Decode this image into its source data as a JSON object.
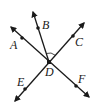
{
  "diagram": {
    "type": "intersecting-lines",
    "colors": {
      "line": "#1a1a1a",
      "background": "#ffffff"
    },
    "center": {
      "label": "D",
      "x": 49,
      "y": 62
    },
    "points": [
      {
        "label": "A",
        "dot": [
          22,
          38
        ],
        "tip": [
          11,
          27
        ],
        "label_pos": [
          10,
          49
        ]
      },
      {
        "label": "B",
        "dot": [
          38,
          28
        ],
        "tip": [
          33,
          12
        ],
        "label_pos": [
          42,
          29
        ]
      },
      {
        "label": "C",
        "dot": [
          73,
          36
        ],
        "tip": [
          84,
          23
        ],
        "label_pos": [
          75,
          46
        ]
      },
      {
        "label": "E",
        "dot": [
          25,
          89
        ],
        "tip": [
          15,
          101
        ],
        "label_pos": [
          17,
          86
        ]
      },
      {
        "label": "F",
        "dot": [
          76,
          86
        ],
        "tip": [
          89,
          97
        ],
        "label_pos": [
          78,
          83
        ]
      }
    ],
    "labels": {
      "A": "A",
      "B": "B",
      "C": "C",
      "D": "D",
      "E": "E",
      "F": "F"
    },
    "angle_marker": {
      "between": [
        "B",
        "C"
      ],
      "vertex": "D"
    }
  }
}
